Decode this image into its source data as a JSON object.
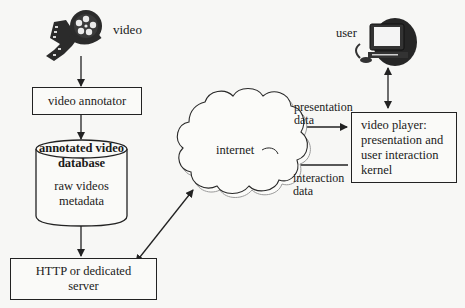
{
  "diagram": {
    "nodes": {
      "video_icon_label": "video",
      "user_icon_label": "user",
      "video_annotator": "video annotator",
      "database": {
        "title_line1": "annotated video",
        "title_line2": "database",
        "content_line1": "raw videos",
        "content_line2": "metadata"
      },
      "server": {
        "line1": "HTTP or dedicated",
        "line2": "server"
      },
      "internet": "internet",
      "video_player": {
        "line1": "video player:",
        "line2": "presentation and",
        "line3": "user interaction",
        "line4": "kernel"
      }
    },
    "edge_labels": {
      "presentation_line1": "presentation",
      "presentation_line2": "data",
      "interaction_line1": "interaction",
      "interaction_line2": "data"
    },
    "edges": [
      {
        "from": "video",
        "to": "video annotator",
        "direction": "one-way"
      },
      {
        "from": "video annotator",
        "to": "annotated video database",
        "direction": "one-way"
      },
      {
        "from": "annotated video database",
        "to": "HTTP or dedicated server",
        "direction": "one-way"
      },
      {
        "from": "HTTP or dedicated server",
        "to": "internet",
        "direction": "two-way"
      },
      {
        "from": "internet",
        "to": "video player",
        "label": "presentation data",
        "direction": "one-way"
      },
      {
        "from": "video player",
        "to": "internet",
        "label": "interaction data",
        "direction": "one-way"
      },
      {
        "from": "user",
        "to": "video player",
        "direction": "two-way"
      }
    ],
    "colors": {
      "line": "#222222",
      "background": "#f7f7f5",
      "cloud_shadow": "#9a9a9a"
    }
  }
}
